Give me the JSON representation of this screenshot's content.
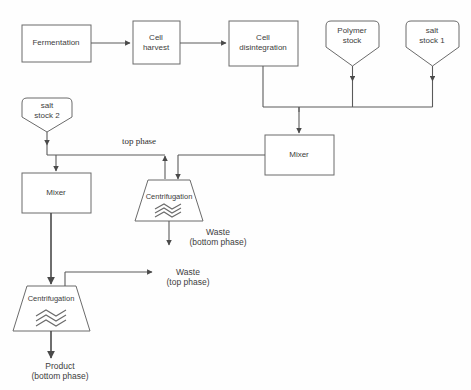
{
  "diagram": {
    "type": "process-flowchart",
    "background_color": "#ffffff",
    "line_color": "#5a5a5a",
    "text_color": "#3d3d3d"
  },
  "nodes": {
    "fermentation": {
      "label": "Fermentation",
      "shape": "rectangle"
    },
    "cell_harvest": {
      "label": "Cell\nharvest",
      "shape": "rectangle"
    },
    "cell_disintegration": {
      "label": "Cell\ndisintegration",
      "shape": "rectangle"
    },
    "polymer_stock": {
      "label": "Polymer\nstock",
      "shape": "funnel"
    },
    "salt_stock_1": {
      "label": "salt\nstock 1",
      "shape": "funnel"
    },
    "salt_stock_2": {
      "label": "salt\nstock 2",
      "shape": "funnel"
    },
    "mixer_right": {
      "label": "Mixer",
      "shape": "rectangle"
    },
    "mixer_left": {
      "label": "Mixer",
      "shape": "rectangle"
    },
    "centrifugation_top": {
      "label": "Centrifugation",
      "shape": "trapezoid"
    },
    "centrifugation_bottom": {
      "label": "Centrifugation",
      "shape": "trapezoid"
    }
  },
  "edge_labels": {
    "top_phase": "top phase"
  },
  "outputs": {
    "waste_bottom": "Waste\n(bottom phase)",
    "waste_top": "Waste\n(top phase)",
    "product_bottom": "Product\n(bottom phase)"
  }
}
